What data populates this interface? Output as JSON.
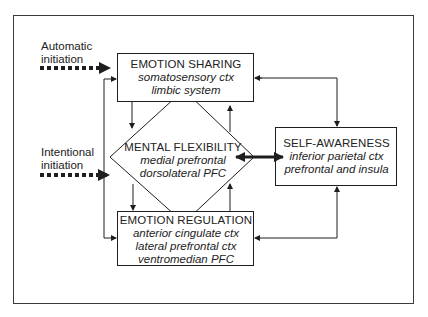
{
  "inputs": [
    {
      "id": "automatic",
      "line1": "Automatic",
      "line2": "initiation"
    },
    {
      "id": "intentional",
      "line1": "Intentional",
      "line2": "initiation"
    }
  ],
  "nodes": {
    "emotion_sharing": {
      "title": "EMOTION SHARING",
      "regions": [
        "somatosensory ctx",
        "limbic system"
      ]
    },
    "mental_flexibility": {
      "title": "MENTAL FLEXIBILITY",
      "regions": [
        "medial prefrontal",
        "dorsolateral PFC"
      ]
    },
    "emotion_regulation": {
      "title": "EMOTION REGULATION",
      "regions": [
        "anterior cingulate ctx",
        "lateral prefrontal ctx",
        "ventromedian PFC"
      ]
    },
    "self_awareness": {
      "title": "SELF-AWARENESS",
      "regions": [
        "inferior parietal ctx",
        "prefrontal and insula"
      ]
    }
  },
  "edges": [
    {
      "from": "automatic_initiation",
      "to": "emotion_sharing",
      "style": "dotted-thick"
    },
    {
      "from": "intentional_initiation",
      "to": "mental_flexibility",
      "style": "dotted-thick"
    },
    {
      "from": "emotion_sharing",
      "to": "mental_flexibility",
      "style": "solid"
    },
    {
      "from": "mental_flexibility",
      "to": "emotion_sharing",
      "style": "solid"
    },
    {
      "from": "mental_flexibility",
      "to": "emotion_regulation",
      "style": "solid"
    },
    {
      "from": "emotion_regulation",
      "to": "mental_flexibility",
      "style": "solid"
    },
    {
      "from": "mental_flexibility",
      "to": "self_awareness",
      "style": "thick-bidirectional"
    },
    {
      "from": "emotion_sharing",
      "to": "self_awareness",
      "style": "solid-bidirectional"
    },
    {
      "from": "self_awareness",
      "to": "emotion_regulation",
      "style": "solid-bidirectional"
    },
    {
      "from": "emotion_regulation",
      "to": "emotion_sharing",
      "style": "solid-bidirectional-left-loop"
    }
  ],
  "colors": {
    "line": "#1e1e1e",
    "frame": "#3a3a3a",
    "background": "#ffffff"
  }
}
